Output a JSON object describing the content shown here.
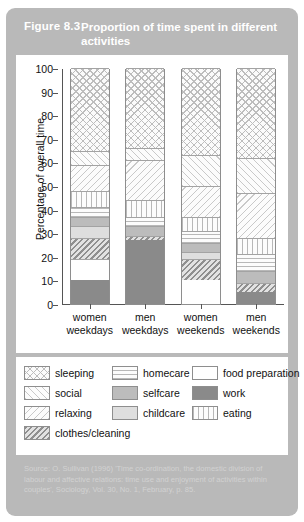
{
  "figure": {
    "number": "Figure 8.3",
    "title": "Proportion of time spent in different activities"
  },
  "source": {
    "text": "Source: O. Sullivan (1996) 'Time co-ordination, the domestic division of labour and affective relations: time use and enjoyment of activities within couples', Sociology, Vol. 30, No. 1, February, p. 85."
  },
  "legend": {
    "items": [
      {
        "label": "sleeping",
        "pattern": "p-sleeping"
      },
      {
        "label": "homecare",
        "pattern": "p-homecare"
      },
      {
        "label": "food preparation",
        "pattern": "p-foodprep"
      },
      {
        "label": "social",
        "pattern": "p-social"
      },
      {
        "label": "selfcare",
        "pattern": "p-selfcare"
      },
      {
        "label": "work",
        "pattern": "p-work"
      },
      {
        "label": "relaxing",
        "pattern": "p-relaxing"
      },
      {
        "label": "childcare",
        "pattern": "p-childcare"
      },
      {
        "label": "eating",
        "pattern": "p-eating"
      },
      {
        "label": "clothes/cleaning",
        "pattern": "p-clothes"
      }
    ]
  },
  "colors": {
    "panel": "#b9b9b9",
    "plot_background": "#ffffff",
    "axis": "#555555",
    "work": "#8a8a8a",
    "selfcare": "#bcbcbc",
    "childcare": "#dedede",
    "food_preparation": "#ffffff",
    "title_text": "#ffffff",
    "source_text": "#d2d2d2"
  },
  "chart_data": {
    "type": "bar",
    "stacked": true,
    "title": "Proportion of time spent in different activities",
    "xlabel": "",
    "ylabel": "Percentage of overall time",
    "ylim": [
      0,
      100
    ],
    "yticks": [
      0,
      10,
      20,
      30,
      40,
      50,
      60,
      70,
      80,
      90,
      100
    ],
    "grid": false,
    "legend_position": "bottom",
    "categories": [
      "women weekdays",
      "men weekdays",
      "women weekends",
      "men weekends"
    ],
    "category_lines": [
      [
        "women",
        "weekdays"
      ],
      [
        "men",
        "weekdays"
      ],
      [
        "women",
        "weekends"
      ],
      [
        "men",
        "weekends"
      ]
    ],
    "series_order_bottom_to_top": [
      "work",
      "food preparation",
      "clothes/cleaning",
      "childcare",
      "selfcare",
      "homecare",
      "eating",
      "relaxing",
      "social",
      "sleeping"
    ],
    "series": [
      {
        "name": "work",
        "pattern": "p-work",
        "values": [
          10,
          27,
          0,
          5
        ]
      },
      {
        "name": "food preparation",
        "pattern": "p-foodprep",
        "values": [
          9,
          0,
          10,
          0
        ]
      },
      {
        "name": "clothes/cleaning",
        "pattern": "p-clothes",
        "values": [
          9,
          2,
          9,
          4
        ]
      },
      {
        "name": "childcare",
        "pattern": "p-childcare",
        "values": [
          5,
          0,
          3,
          0
        ]
      },
      {
        "name": "selfcare",
        "pattern": "p-selfcare",
        "values": [
          4,
          4,
          4,
          5
        ]
      },
      {
        "name": "homecare",
        "pattern": "p-homecare",
        "values": [
          4,
          4,
          5,
          7
        ]
      },
      {
        "name": "eating",
        "pattern": "p-eating",
        "values": [
          7,
          7,
          6,
          7
        ]
      },
      {
        "name": "relaxing",
        "pattern": "p-relaxing",
        "values": [
          11,
          17,
          13,
          19
        ]
      },
      {
        "name": "social",
        "pattern": "p-social",
        "values": [
          6,
          5,
          13,
          15
        ]
      },
      {
        "name": "sleeping",
        "pattern": "p-sleeping",
        "values": [
          35,
          34,
          37,
          38
        ]
      }
    ]
  }
}
